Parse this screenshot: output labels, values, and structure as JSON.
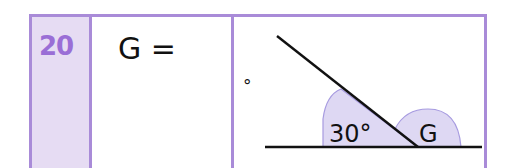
{
  "question": {
    "number": "20",
    "answer_prompt": {
      "variable": "G",
      "equals": "=",
      "unit_symbol": "°"
    },
    "diagram": {
      "given_angle_label": "30°",
      "unknown_angle_label": "G"
    }
  },
  "colors": {
    "border": "#a98bd8",
    "number_cell_bg": "#e6dcf3",
    "number_text": "#9a6ed6",
    "angle_fill": "#ded8f3",
    "angle_stroke": "#a79be0",
    "line": "#111111"
  }
}
